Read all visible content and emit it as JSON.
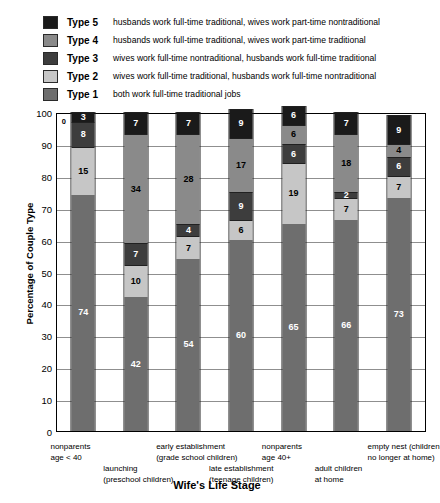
{
  "legend": {
    "items": [
      {
        "key": "Type 5",
        "desc": "husbands work full-time traditional, wives work part-time nontraditional",
        "color": "#1a1a1a"
      },
      {
        "key": "Type 4",
        "desc": "husbands work full-time traditional, wives work part-time traditional",
        "color": "#8a8a8a"
      },
      {
        "key": "Type 3",
        "desc": "wives work full-time nontraditional, husbands work full-time traditional",
        "color": "#3d3d3d"
      },
      {
        "key": "Type 2",
        "desc": "wives work full-time traditional, husbands work full-time nontraditional",
        "color": "#c6c6c6"
      },
      {
        "key": "Type 1",
        "desc": "both work full-time traditional jobs",
        "color": "#6e6e6e"
      }
    ]
  },
  "chart_data": {
    "type": "bar",
    "stacked": true,
    "title": "",
    "xlabel": "Wife's Life Stage",
    "ylabel": "Percentage of Couple Type",
    "ylim": [
      0,
      100
    ],
    "yticks": [
      0,
      10,
      20,
      30,
      40,
      50,
      60,
      70,
      80,
      90,
      100
    ],
    "grid": true,
    "legend_position": "top",
    "categories": [
      "nonparents age < 40",
      "launching (preschool children)",
      "early establishment (grade school children)",
      "late establishment (teenage children)",
      "nonparents age 40+",
      "adult children at home",
      "empty nest (children no longer at home)"
    ],
    "category_labels": [
      {
        "line1": "nonparents",
        "line2": "age < 40",
        "row": 0
      },
      {
        "line1": "launching",
        "line2": "(preschool children)",
        "row": 1
      },
      {
        "line1": "early establishment",
        "line2": "(grade school children)",
        "row": 0
      },
      {
        "line1": "late establishment",
        "line2": "(teenage children)",
        "row": 1
      },
      {
        "line1": "nonparents",
        "line2": "age 40+",
        "row": 0
      },
      {
        "line1": "adult children",
        "line2": "at home",
        "row": 1
      },
      {
        "line1": "empty nest (children",
        "line2": "no longer at home)",
        "row": 0
      }
    ],
    "series": [
      {
        "name": "Type 1",
        "color": "#6e6e6e",
        "values": [
          74,
          42,
          54,
          60,
          65,
          66,
          73
        ]
      },
      {
        "name": "Type 2",
        "color": "#c6c6c6",
        "values": [
          15,
          10,
          7,
          6,
          19,
          7,
          7
        ]
      },
      {
        "name": "Type 3",
        "color": "#3d3d3d",
        "values": [
          8,
          7,
          4,
          9,
          6,
          2,
          6
        ]
      },
      {
        "name": "Type 4",
        "color": "#8a8a8a",
        "values": [
          0,
          34,
          28,
          17,
          6,
          18,
          4
        ]
      },
      {
        "name": "Type 5",
        "color": "#1a1a1a",
        "values": [
          3,
          7,
          7,
          9,
          6,
          7,
          9
        ]
      }
    ]
  }
}
